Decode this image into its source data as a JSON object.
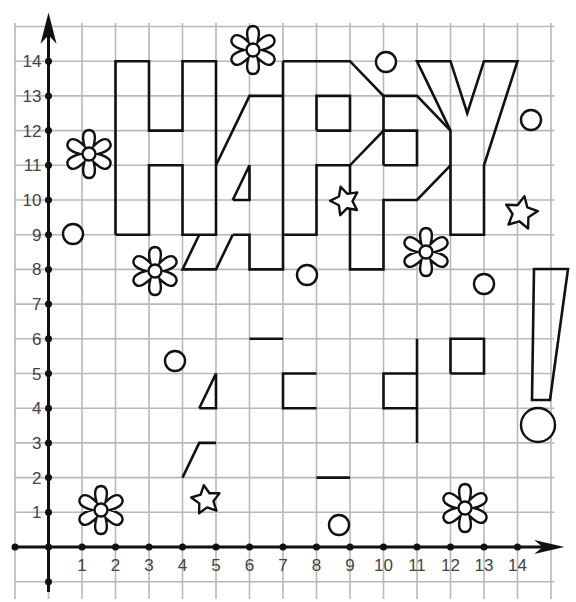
{
  "diagram": {
    "grid": {
      "origin_px": [
        48.5,
        547
      ],
      "unit_px": [
        33.5,
        34.7
      ],
      "x_range": [
        -1,
        15
      ],
      "y_range": [
        -1,
        15
      ]
    },
    "axes": {
      "x_ticks": [
        "1",
        "2",
        "3",
        "4",
        "5",
        "6",
        "7",
        "8",
        "9",
        "10",
        "11",
        "12",
        "13",
        "14"
      ],
      "y_ticks": [
        "1",
        "2",
        "3",
        "4",
        "5",
        "6",
        "7",
        "8",
        "9",
        "10",
        "11",
        "12",
        "13",
        "14"
      ]
    },
    "letters": [
      {
        "name": "H",
        "points": [
          [
            2,
            9
          ],
          [
            2,
            14
          ],
          [
            3,
            14
          ],
          [
            3,
            12
          ],
          [
            4,
            12
          ],
          [
            4,
            14
          ],
          [
            5,
            14
          ],
          [
            5,
            9
          ],
          [
            4,
            9
          ],
          [
            4,
            11
          ],
          [
            3,
            11
          ],
          [
            3,
            9
          ],
          [
            2,
            9
          ]
        ]
      },
      {
        "name": "A-upper",
        "points": [
          [
            5,
            11
          ],
          [
            6,
            13
          ],
          [
            7,
            13
          ]
        ]
      },
      {
        "name": "A-right-and-P-left",
        "points": [
          [
            7,
            14
          ],
          [
            7,
            8
          ],
          [
            6,
            8
          ],
          [
            6,
            9
          ],
          [
            5.5,
            9
          ]
        ]
      },
      {
        "name": "A-hole",
        "points": [
          [
            5.5,
            10
          ],
          [
            6,
            11
          ],
          [
            6,
            10
          ],
          [
            5.5,
            10
          ]
        ]
      },
      {
        "name": "A-shifted-foot",
        "points": [
          [
            4.5,
            9
          ],
          [
            4,
            8
          ],
          [
            5,
            8
          ],
          [
            5.5,
            9
          ]
        ]
      },
      {
        "name": "P1-outline",
        "points": [
          [
            7,
            14
          ],
          [
            9,
            14
          ],
          [
            10,
            13
          ],
          [
            11,
            13
          ],
          [
            12,
            12
          ]
        ]
      },
      {
        "name": "P1-bottom",
        "points": [
          [
            7,
            9
          ],
          [
            8,
            9
          ],
          [
            8,
            11
          ],
          [
            9,
            11
          ],
          [
            10,
            12
          ],
          [
            10,
            13
          ]
        ]
      },
      {
        "name": "P1-hole",
        "points": [
          [
            8,
            12
          ],
          [
            9,
            12
          ],
          [
            9,
            13
          ],
          [
            8,
            13
          ],
          [
            8,
            12
          ]
        ]
      },
      {
        "name": "P2-stem",
        "points": [
          [
            9,
            11
          ],
          [
            9,
            8
          ],
          [
            10,
            8
          ],
          [
            10,
            10
          ],
          [
            11,
            10
          ],
          [
            12,
            11
          ]
        ]
      },
      {
        "name": "P2-hole",
        "points": [
          [
            10,
            11
          ],
          [
            11,
            11
          ],
          [
            11,
            12
          ],
          [
            10,
            12
          ],
          [
            10,
            11
          ]
        ]
      },
      {
        "name": "Y",
        "points": [
          [
            11.5,
            13
          ],
          [
            11,
            14
          ],
          [
            12,
            14
          ],
          [
            12.5,
            12.5
          ],
          [
            13,
            14
          ],
          [
            14,
            14
          ],
          [
            13,
            11
          ],
          [
            13,
            9
          ],
          [
            12,
            9
          ],
          [
            12,
            12
          ],
          [
            11.5,
            13
          ]
        ]
      }
    ],
    "loose_segments": [
      {
        "name": "triangle-piece",
        "points": [
          [
            4.5,
            4
          ],
          [
            5,
            5
          ],
          [
            5,
            4
          ],
          [
            4.5,
            4
          ]
        ]
      },
      {
        "name": "slant-piece",
        "points": [
          [
            4,
            2
          ],
          [
            4.5,
            3
          ],
          [
            5,
            3
          ]
        ]
      },
      {
        "name": "dash-piece-1",
        "points": [
          [
            6,
            6
          ],
          [
            7,
            6
          ]
        ]
      },
      {
        "name": "bracket-piece-1",
        "points": [
          [
            8,
            5
          ],
          [
            7,
            5
          ],
          [
            7,
            4
          ],
          [
            8,
            4
          ]
        ]
      },
      {
        "name": "dash-piece-2",
        "points": [
          [
            8,
            2
          ],
          [
            9,
            2
          ]
        ]
      },
      {
        "name": "vertical-piece",
        "points": [
          [
            11,
            6
          ],
          [
            11,
            3
          ]
        ]
      },
      {
        "name": "bracket-piece-2",
        "points": [
          [
            11,
            5
          ],
          [
            10,
            5
          ],
          [
            10,
            4
          ],
          [
            11,
            4
          ]
        ]
      },
      {
        "name": "square-piece",
        "points": [
          [
            12,
            5
          ],
          [
            13,
            5
          ],
          [
            13,
            6
          ],
          [
            12,
            6
          ],
          [
            12,
            5
          ]
        ]
      }
    ],
    "exclamation": {
      "bar_px": [
        [
          534,
          269
        ],
        [
          568,
          269
        ],
        [
          550,
          400
        ],
        [
          532,
          400
        ]
      ],
      "dot_px": {
        "cx": 538,
        "cy": 425,
        "r": 17
      }
    },
    "flowers_px": [
      {
        "cx": 253,
        "cy": 50,
        "r": 24
      },
      {
        "cx": 89,
        "cy": 154,
        "r": 24
      },
      {
        "cx": 155,
        "cy": 271,
        "r": 24
      },
      {
        "cx": 426,
        "cy": 252,
        "r": 24
      },
      {
        "cx": 101,
        "cy": 510,
        "r": 24
      },
      {
        "cx": 465,
        "cy": 508,
        "r": 24
      }
    ],
    "stars_px": [
      {
        "cx": 345,
        "cy": 201,
        "r": 15
      },
      {
        "cx": 521,
        "cy": 213,
        "r": 17
      },
      {
        "cx": 206,
        "cy": 500,
        "r": 15
      }
    ],
    "circles_px": [
      {
        "cx": 73,
        "cy": 234,
        "r": 10
      },
      {
        "cx": 386,
        "cy": 62,
        "r": 10
      },
      {
        "cx": 531,
        "cy": 120,
        "r": 10
      },
      {
        "cx": 307,
        "cy": 275,
        "r": 10
      },
      {
        "cx": 484,
        "cy": 284,
        "r": 10
      },
      {
        "cx": 175,
        "cy": 361,
        "r": 10
      },
      {
        "cx": 339,
        "cy": 525,
        "r": 10
      }
    ],
    "colors": {
      "ink": "#111111",
      "grid": "#b8b8b8",
      "label": "#444444",
      "background": "#ffffff"
    }
  }
}
